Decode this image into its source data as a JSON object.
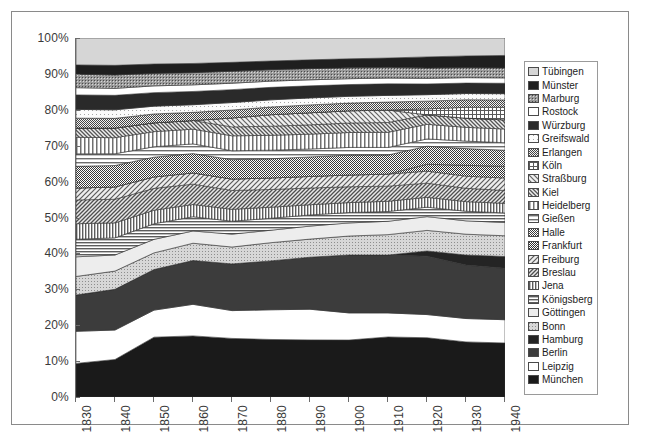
{
  "chart_data": {
    "type": "area",
    "title": "",
    "subtitle": "",
    "xlabel": "",
    "ylabel": "",
    "stacked": "100%",
    "grid": false,
    "legend_position": "right",
    "xlim": [
      1830,
      1940
    ],
    "ylim": [
      0,
      100
    ],
    "x": [
      1830,
      1840,
      1850,
      1860,
      1870,
      1880,
      1890,
      1900,
      1910,
      1920,
      1930,
      1940
    ],
    "xtick_labels": [
      "1830",
      "1840",
      "1850",
      "1860",
      "1870",
      "1880",
      "1890",
      "1900",
      "1910",
      "1920",
      "1930",
      "1940"
    ],
    "ytick_labels": [
      "0%",
      "10%",
      "20%",
      "30%",
      "40%",
      "50%",
      "60%",
      "70%",
      "80%",
      "90%",
      "100%"
    ],
    "ytick_values": [
      0,
      10,
      20,
      30,
      40,
      50,
      60,
      70,
      80,
      90,
      100
    ],
    "series": [
      {
        "name": "München",
        "pattern": "solid-black",
        "color": "#1a1a1a",
        "values": [
          6.5,
          7.0,
          11.5,
          12.0,
          11.8,
          12.0,
          12.3,
          12.6,
          13.5,
          13.8,
          13.2,
          13.0
        ]
      },
      {
        "name": "Leipzig",
        "pattern": "solid-white",
        "color": "#ffffff",
        "values": [
          6.2,
          5.5,
          5.2,
          6.2,
          5.6,
          6.2,
          6.6,
          6.0,
          5.4,
          5.4,
          5.6,
          5.6
        ]
      },
      {
        "name": "Berlin",
        "pattern": "solid-darkgray",
        "color": "#3c3c3c",
        "values": [
          7.0,
          7.6,
          7.8,
          8.6,
          9.4,
          10.2,
          11.2,
          12.8,
          13.0,
          13.6,
          12.8,
          12.4
        ]
      },
      {
        "name": "Hamburg",
        "pattern": "solid-black2",
        "color": "#242424",
        "values": [
          0.0,
          0.0,
          0.0,
          0.0,
          0.0,
          0.0,
          0.0,
          0.0,
          0.0,
          1.2,
          2.4,
          2.8
        ]
      },
      {
        "name": "Bonn",
        "pattern": "light-dots",
        "color": "#c9c9c9",
        "values": [
          3.6,
          3.4,
          3.2,
          3.4,
          3.4,
          3.8,
          3.9,
          4.2,
          4.6,
          4.8,
          5.0,
          5.0
        ]
      },
      {
        "name": "Göttingen",
        "pattern": "very-light",
        "color": "#ededed",
        "values": [
          3.8,
          3.0,
          2.6,
          2.4,
          2.6,
          2.6,
          2.8,
          2.9,
          3.0,
          3.2,
          3.2,
          3.2
        ]
      },
      {
        "name": "Königsberg",
        "pattern": "horiz-lines",
        "color": "#8f8f8f",
        "values": [
          3.4,
          3.2,
          3.0,
          2.8,
          2.6,
          2.5,
          2.4,
          2.3,
          2.2,
          2.2,
          2.3,
          2.3
        ]
      },
      {
        "name": "Jena",
        "pattern": "vert-lines",
        "color": "#9c9c9c",
        "values": [
          3.0,
          2.8,
          2.6,
          2.4,
          2.4,
          2.3,
          2.2,
          2.2,
          2.3,
          2.3,
          2.3,
          2.3
        ]
      },
      {
        "name": "Breslau",
        "pattern": "diag-lines-b",
        "color": "#8a8a8a",
        "values": [
          4.6,
          4.4,
          4.2,
          4.0,
          3.8,
          3.7,
          3.6,
          3.5,
          3.4,
          3.3,
          3.2,
          3.1
        ]
      },
      {
        "name": "Freiburg",
        "pattern": "diag-lines-f",
        "color": "#9a9a9a",
        "values": [
          2.3,
          2.3,
          2.2,
          2.2,
          2.3,
          2.4,
          2.5,
          2.6,
          2.7,
          2.8,
          2.9,
          3.0
        ]
      },
      {
        "name": "Frankfurt",
        "pattern": "dense-check",
        "color": "#6e6e6e",
        "values": [
          0.0,
          0.0,
          0.0,
          0.0,
          0.0,
          0.0,
          0.0,
          0.0,
          0.0,
          1.6,
          2.6,
          2.8
        ]
      },
      {
        "name": "Halle",
        "pattern": "dense-check2",
        "color": "#767676",
        "values": [
          4.2,
          4.0,
          3.8,
          3.8,
          3.9,
          4.0,
          4.2,
          4.4,
          4.3,
          4.2,
          4.0,
          3.9
        ]
      },
      {
        "name": "Gießen",
        "pattern": "horiz-lines-2",
        "color": "#a8a8a8",
        "values": [
          2.4,
          2.2,
          2.0,
          1.9,
          1.8,
          1.8,
          1.7,
          1.7,
          1.7,
          1.7,
          1.8,
          1.8
        ]
      },
      {
        "name": "Heidelberg",
        "pattern": "vert-lines-2",
        "color": "#b0b0b0",
        "values": [
          3.2,
          3.0,
          2.9,
          2.9,
          3.0,
          3.1,
          3.2,
          3.3,
          3.4,
          3.4,
          3.3,
          3.3
        ]
      },
      {
        "name": "Kiel",
        "pattern": "diag-lines-k",
        "color": "#a2a2a2",
        "values": [
          1.8,
          1.8,
          1.7,
          1.7,
          1.8,
          1.9,
          2.0,
          2.1,
          2.2,
          2.2,
          2.2,
          2.2
        ]
      },
      {
        "name": "Straßburg",
        "pattern": "diag-lines-s",
        "color": "#b8b8b8",
        "values": [
          0.0,
          0.0,
          0.0,
          0.0,
          1.8,
          2.4,
          2.6,
          2.7,
          2.8,
          0.0,
          0.0,
          0.0
        ]
      },
      {
        "name": "Köln",
        "pattern": "grid-lines",
        "color": "#bdbdbd",
        "values": [
          0.0,
          0.0,
          0.0,
          0.0,
          0.0,
          0.0,
          0.0,
          0.0,
          0.0,
          1.4,
          2.6,
          3.0
        ]
      },
      {
        "name": "Erlangen",
        "pattern": "dense-check3",
        "color": "#7e7e7e",
        "values": [
          1.9,
          1.8,
          1.7,
          1.6,
          1.6,
          1.6,
          1.7,
          1.7,
          1.8,
          1.8,
          1.8,
          1.8
        ]
      },
      {
        "name": "Greifswald",
        "pattern": "sparse-dots",
        "color": "#f2f2f2",
        "values": [
          1.7,
          1.6,
          1.5,
          1.5,
          1.5,
          1.5,
          1.5,
          1.5,
          1.5,
          1.5,
          1.5,
          1.5
        ]
      },
      {
        "name": "Würzburg",
        "pattern": "solid-black3",
        "color": "#2a2a2a",
        "values": [
          2.8,
          2.7,
          2.6,
          2.6,
          2.6,
          2.6,
          2.6,
          2.6,
          2.6,
          2.5,
          2.5,
          2.5
        ]
      },
      {
        "name": "Rostock",
        "pattern": "solid-white2",
        "color": "#ffffff",
        "values": [
          1.4,
          1.3,
          1.3,
          1.3,
          1.3,
          1.3,
          1.3,
          1.3,
          1.3,
          1.3,
          1.3,
          1.3
        ]
      },
      {
        "name": "Marburg",
        "pattern": "med-dots",
        "color": "#707070",
        "values": [
          2.6,
          2.5,
          2.4,
          2.4,
          2.4,
          2.4,
          2.4,
          2.4,
          2.4,
          2.4,
          2.4,
          2.4
        ]
      },
      {
        "name": "Münster",
        "pattern": "solid-black4",
        "color": "#1f1f1f",
        "values": [
          1.8,
          1.8,
          1.8,
          1.8,
          1.8,
          1.8,
          1.9,
          2.0,
          2.1,
          2.6,
          2.8,
          3.0
        ]
      },
      {
        "name": "Tübingen",
        "pattern": "pale-gray",
        "color": "#d6d6d6",
        "values": [
          5.2,
          5.1,
          5.0,
          5.0,
          4.9,
          4.8,
          4.7,
          4.6,
          4.5,
          4.4,
          4.3,
          4.2
        ]
      }
    ]
  },
  "legend": {
    "items": [
      {
        "label": "Tübingen"
      },
      {
        "label": "Münster"
      },
      {
        "label": "Marburg"
      },
      {
        "label": "Rostock"
      },
      {
        "label": "Würzburg"
      },
      {
        "label": "Greifswald"
      },
      {
        "label": "Erlangen"
      },
      {
        "label": "Köln"
      },
      {
        "label": "Straßburg"
      },
      {
        "label": "Kiel"
      },
      {
        "label": "Heidelberg"
      },
      {
        "label": "Gießen"
      },
      {
        "label": "Halle"
      },
      {
        "label": "Frankfurt"
      },
      {
        "label": "Freiburg"
      },
      {
        "label": "Breslau"
      },
      {
        "label": "Jena"
      },
      {
        "label": "Königsberg"
      },
      {
        "label": "Göttingen"
      },
      {
        "label": "Bonn"
      },
      {
        "label": "Hamburg"
      },
      {
        "label": "Berlin"
      },
      {
        "label": "Leipzig"
      },
      {
        "label": "München"
      }
    ]
  }
}
